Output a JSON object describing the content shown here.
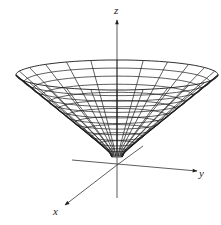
{
  "figure": {
    "colors": {
      "line": "#1a1a1a",
      "axis": "#333333",
      "background": "#ffffff"
    },
    "axes": {
      "z": {
        "label": "z"
      },
      "y": {
        "label": "y"
      },
      "x": {
        "label": "x"
      }
    },
    "surface": {
      "type": "cone",
      "rings": 12,
      "meridians": 24
    }
  }
}
